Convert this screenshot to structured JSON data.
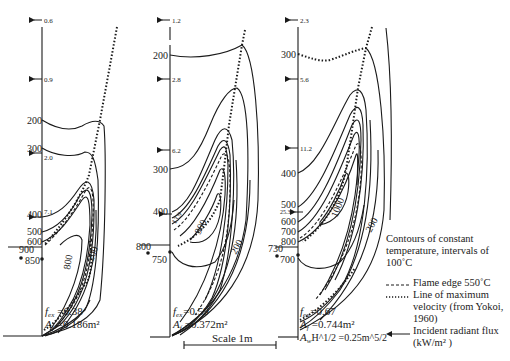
{
  "figure": {
    "panels": [
      {
        "id": "a",
        "flux_arrows": [
          {
            "value": "0.6",
            "y": 20
          },
          {
            "value": "0.9",
            "y": 79
          },
          {
            "value": "2.0",
            "y": 153
          },
          {
            "value": "7.1",
            "y": 217
          }
        ],
        "axis_temps": [
          {
            "value": "200",
            "y": 120
          },
          {
            "value": "300",
            "y": 148
          },
          {
            "value": "400",
            "y": 214
          },
          {
            "value": "500",
            "y": 231
          },
          {
            "value": "600",
            "y": 241
          },
          {
            "value": "850",
            "y": 260
          }
        ],
        "outside_temp": {
          "value": "900",
          "y": 250
        },
        "contour_labels": [
          {
            "value": "800"
          },
          {
            "value": "200"
          }
        ],
        "params": [
          {
            "symbol": "f",
            "sub": "ex",
            "value": "=0.38"
          },
          {
            "symbol": "A",
            "sub": "f",
            "value": "=0.186m²"
          }
        ]
      },
      {
        "id": "b",
        "flux_arrows": [
          {
            "value": "1.2",
            "y": 20
          },
          {
            "value": "2.8",
            "y": 79
          },
          {
            "value": "6.2",
            "y": 150
          },
          {
            "value": "13.9",
            "y": 214
          }
        ],
        "axis_temps": [
          {
            "value": "200",
            "y": 55
          },
          {
            "value": "300",
            "y": 169
          },
          {
            "value": "400",
            "y": 211
          },
          {
            "value": "750",
            "y": 258
          }
        ],
        "outside_temp": {
          "value": "800",
          "y": 246
        },
        "contour_labels": [
          {
            "value": "900"
          },
          {
            "value": "200"
          }
        ],
        "params": [
          {
            "symbol": "f",
            "sub": "ex",
            "value": "=0.59"
          },
          {
            "symbol": "A",
            "sub": "f",
            "value": "=0.372m²"
          }
        ]
      },
      {
        "id": "c",
        "flux_arrows": [
          {
            "value": "2.3",
            "y": 20
          },
          {
            "value": "5.6",
            "y": 79
          },
          {
            "value": "11.2",
            "y": 148
          },
          {
            "value": "25.3",
            "y": 212
          }
        ],
        "axis_temps": [
          {
            "value": "300",
            "y": 54
          },
          {
            "value": "400",
            "y": 173
          },
          {
            "value": "500",
            "y": 205
          },
          {
            "value": "600",
            "y": 222
          },
          {
            "value": "700",
            "y": 232
          },
          {
            "value": "800",
            "y": 242
          },
          {
            "value": "700",
            "y": 260
          }
        ],
        "outside_temp": {
          "value": "730",
          "y": 248
        },
        "contour_labels": [
          {
            "value": "1000"
          },
          {
            "value": "200"
          }
        ],
        "params": [
          {
            "symbol": "f",
            "sub": "ex",
            "value": "=0.67"
          },
          {
            "symbol": "A",
            "sub": "f",
            "value": "=0.744m²"
          },
          {
            "symbol": "A",
            "sub": "w",
            "value": "H^1/2 =0.25m^5/2"
          }
        ]
      }
    ],
    "scale_bar": {
      "label": "Scale 1m"
    },
    "legend": {
      "title": "Contours of constant temperature, intervals of 100˚C",
      "items": [
        {
          "symbol": "dashed",
          "label": "Flame edge 550˚C"
        },
        {
          "symbol": "dotted",
          "label": "Line of maximum velocity (from Yokoi, 1960)"
        },
        {
          "symbol": "arrow",
          "label": "Incident radiant flux (kW/m² )"
        }
      ]
    },
    "colors": {
      "ink": "#1a1a1a",
      "background": "#ffffff"
    }
  }
}
